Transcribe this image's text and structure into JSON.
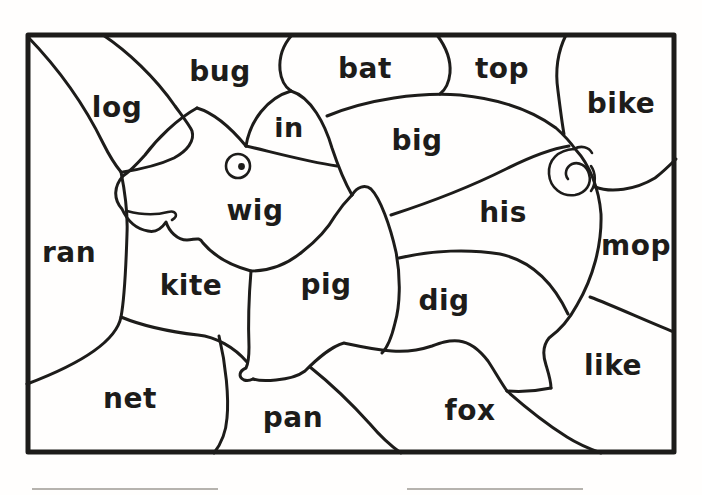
{
  "worksheet": {
    "kind": "color-by-word hidden pig coloring puzzle",
    "colors": {
      "ink": "#1d1c1a",
      "paper": "#fffefd",
      "answer_blank_line": "#b6b3ae"
    }
  },
  "regions": [
    {
      "label": "log"
    },
    {
      "label": "bug"
    },
    {
      "label": "bat"
    },
    {
      "label": "top"
    },
    {
      "label": "bike"
    },
    {
      "label": "in"
    },
    {
      "label": "big"
    },
    {
      "label": "wig"
    },
    {
      "label": "his"
    },
    {
      "label": "mop"
    },
    {
      "label": "ran"
    },
    {
      "label": "kite"
    },
    {
      "label": "pig"
    },
    {
      "label": "dig"
    },
    {
      "label": "like"
    },
    {
      "label": "net"
    },
    {
      "label": "pan"
    },
    {
      "label": "fox"
    }
  ]
}
